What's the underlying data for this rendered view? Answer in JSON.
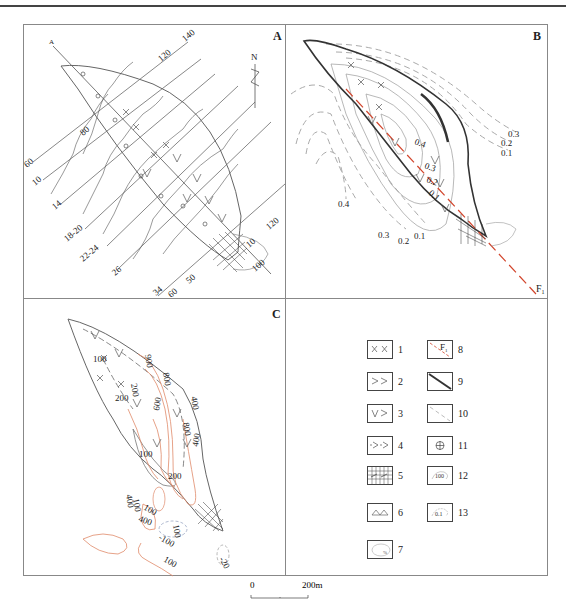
{
  "figure": {
    "panels": {
      "A": {
        "label": "A",
        "north_label": "N",
        "profile_marker": "A",
        "line_labels": [
          "140",
          "120",
          "80",
          "60",
          "10",
          "14",
          "18-20",
          "22-24",
          "26",
          "34",
          "60",
          "50",
          "120",
          "10",
          "100"
        ]
      },
      "B": {
        "label": "B",
        "fault_label": "F",
        "fault_sub": "1",
        "contour_labels_right": [
          "0.3",
          "0.2",
          "0.1"
        ],
        "contour_labels_inner": [
          "0.4",
          "0.3",
          "0.2",
          "0.1"
        ],
        "contour_labels_left": [
          "0.4",
          "0.3",
          "0.2",
          "0.1"
        ]
      },
      "C": {
        "label": "C",
        "contour_labels": [
          "100",
          "200",
          "200",
          "900",
          "800",
          "600",
          "800",
          "400",
          "100",
          "200",
          "400",
          "100",
          "400",
          "100",
          "400",
          "100",
          "-100",
          "100",
          "100",
          "-20"
        ]
      },
      "legend": {
        "items": [
          {
            "num": "1",
            "symbol": "x-x"
          },
          {
            "num": "2",
            "symbol": "gt-gt"
          },
          {
            "num": "3",
            "symbol": "v-gt"
          },
          {
            "num": "4",
            "symbol": "dash-gt"
          },
          {
            "num": "5",
            "symbol": "grid-hatch"
          },
          {
            "num": "6",
            "symbol": "mountain"
          },
          {
            "num": "7",
            "symbol": "ellipse-percent"
          },
          {
            "num": "8",
            "symbol": "fault-F1",
            "text": "F",
            "sub": "1"
          },
          {
            "num": "9",
            "symbol": "double-line"
          },
          {
            "num": "10",
            "symbol": "dashed-line"
          },
          {
            "num": "11",
            "symbol": "circle-cross"
          },
          {
            "num": "12",
            "symbol": "contour-100",
            "text": "100"
          },
          {
            "num": "13",
            "symbol": "contour-0.1",
            "text": "0.1"
          }
        ]
      }
    },
    "scale_bar": {
      "start": "0",
      "end": "200m"
    },
    "colors": {
      "line": "#555555",
      "red": "#d2452c",
      "orange": "#e08a6a",
      "gray_dash": "#aaaaaa"
    }
  }
}
